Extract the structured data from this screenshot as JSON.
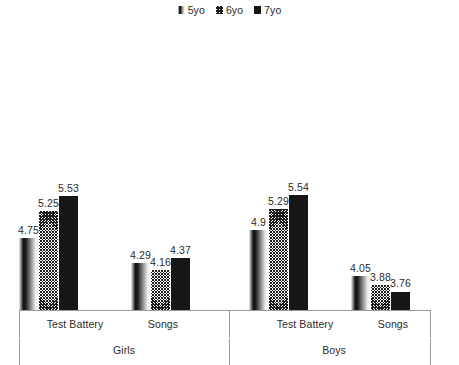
{
  "chart_data": {
    "type": "bar",
    "title": "",
    "xlabel": "",
    "ylabel": "",
    "grid": false,
    "legend_position": "top-center",
    "axis_baseline_value": 3.4,
    "ylim": [
      3.4,
      5.9
    ],
    "group_levels": [
      {
        "label": "Girls",
        "children": [
          "Test Battery",
          "Songs"
        ]
      },
      {
        "label": "Boys",
        "children": [
          "Test Battery",
          "Songs"
        ]
      }
    ],
    "categories": [
      "Test Battery",
      "Songs",
      "Test Battery",
      "Songs"
    ],
    "series": [
      {
        "name": "5yo",
        "fill": "gradient",
        "values": [
          4.75,
          4.29,
          4.9,
          4.05
        ]
      },
      {
        "name": "6yo",
        "fill": "crosshatch",
        "values": [
          5.25,
          4.16,
          5.29,
          3.88
        ]
      },
      {
        "name": "7yo",
        "fill": "solid-black",
        "values": [
          5.53,
          4.37,
          5.54,
          3.76
        ]
      }
    ],
    "value_labels": [
      "4.75",
      "5.25",
      "5.53",
      "4.29",
      "4.16",
      "4.37",
      "4.9",
      "5.29",
      "5.54",
      "4.05",
      "3.88",
      "3.76"
    ]
  },
  "legend": {
    "items": [
      {
        "label": "5yo",
        "swatch": "gradient-swatch"
      },
      {
        "label": "6yo",
        "swatch": "crosshatch-swatch"
      },
      {
        "label": "7yo",
        "swatch": "solid-black-swatch"
      }
    ]
  },
  "axis": {
    "inner_labels": [
      "Test Battery",
      "Songs",
      "Test Battery",
      "Songs"
    ],
    "outer_labels": [
      "Girls",
      "Boys"
    ]
  },
  "colors": {
    "bar_solid": "#161616",
    "hatch": "#1d1d1d",
    "axis": "#9a9a9a",
    "text": "#2b2b2b",
    "background": "#ffffff"
  }
}
